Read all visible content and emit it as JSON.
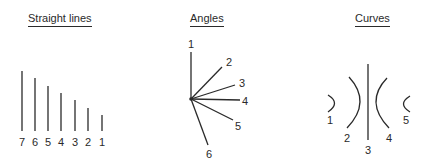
{
  "panels": {
    "straight_lines": {
      "title": "Straight lines",
      "lines": [
        {
          "label": "7",
          "x": 22,
          "top": 71,
          "bottom": 131
        },
        {
          "label": "6",
          "x": 35,
          "top": 78,
          "bottom": 131
        },
        {
          "label": "5",
          "x": 48,
          "top": 86,
          "bottom": 131
        },
        {
          "label": "4",
          "x": 61,
          "top": 93,
          "bottom": 131
        },
        {
          "label": "3",
          "x": 75,
          "top": 100,
          "bottom": 131
        },
        {
          "label": "2",
          "x": 88,
          "top": 108,
          "bottom": 131
        },
        {
          "label": "1",
          "x": 102,
          "top": 115,
          "bottom": 131
        }
      ]
    },
    "angles": {
      "title": "Angles",
      "vertex": {
        "x": 191,
        "y": 99
      },
      "rays": [
        {
          "label": "1",
          "x2": 191,
          "y2": 52
        },
        {
          "label": "2",
          "x2": 222,
          "y2": 67
        },
        {
          "label": "3",
          "x2": 235,
          "y2": 85
        },
        {
          "label": "4",
          "x2": 240,
          "y2": 100
        },
        {
          "label": "5",
          "x2": 233,
          "y2": 120
        },
        {
          "label": "6",
          "x2": 208,
          "y2": 145
        }
      ]
    },
    "curves": {
      "title": "Curves",
      "items": [
        {
          "label": "1",
          "type": "arc-right-small"
        },
        {
          "label": "2",
          "type": "arc-right-large"
        },
        {
          "label": "3",
          "type": "straight-vertical"
        },
        {
          "label": "4",
          "type": "arc-left-large"
        },
        {
          "label": "5",
          "type": "arc-left-small"
        }
      ]
    }
  },
  "colors": {
    "stroke": "#2a2a2a",
    "background": "#ffffff"
  }
}
